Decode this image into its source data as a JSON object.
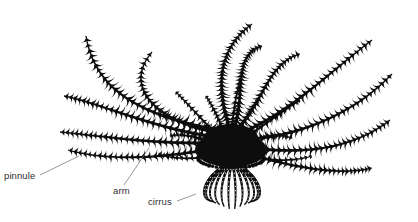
{
  "figure": {
    "kind": "scientific-line-drawing",
    "background_color": "#ffffff",
    "ink_color": "#0d0d0d",
    "width": 418,
    "height": 222
  },
  "labels": [
    {
      "id": "pinnule",
      "text": "pinnule",
      "text_x": 4,
      "text_y": 179,
      "leader": {
        "x1": 40,
        "y1": 175,
        "x2": 79,
        "y2": 156
      },
      "color": "#2e2e2e"
    },
    {
      "id": "arm",
      "text": "arm",
      "text_x": 113,
      "text_y": 194,
      "leader": {
        "x1": 124,
        "y1": 185,
        "x2": 149,
        "y2": 148
      },
      "color": "#2e2e2e"
    },
    {
      "id": "cirrus",
      "text": "cirrus",
      "text_x": 148,
      "text_y": 205,
      "leader": {
        "x1": 177,
        "y1": 201,
        "x2": 196,
        "y2": 194
      },
      "color": "#2e2e2e"
    }
  ],
  "leader_color": "#6d6d6d",
  "anatomy": {
    "arm_count": 10,
    "cirri_count": 12,
    "calyx_label": "central disc"
  }
}
